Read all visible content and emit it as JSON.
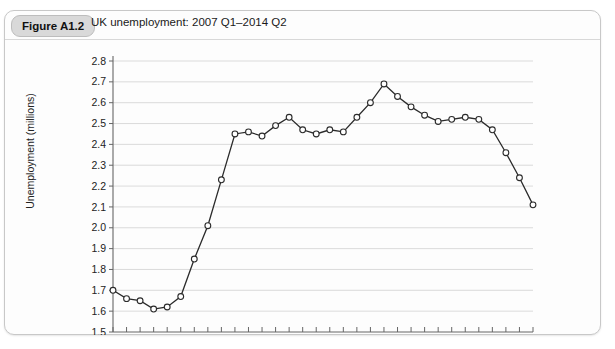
{
  "figure": {
    "badge": "Figure A1.2",
    "title": "UK unemployment: 2007 Q1–2014 Q2"
  },
  "chart_data": {
    "type": "line",
    "title": "UK unemployment: 2007 Q1–2014 Q2",
    "xlabel": "",
    "ylabel": "Unemployment (millions)",
    "ylim": [
      1.5,
      2.8
    ],
    "ytick_labels": [
      "1.5",
      "1.6",
      "1.7",
      "1.8",
      "1.9",
      "2.0",
      "2.1",
      "2.2",
      "2.3",
      "2.4",
      "2.5",
      "2.6",
      "2.7",
      "2.8"
    ],
    "ytick_values": [
      1.5,
      1.6,
      1.7,
      1.8,
      1.9,
      2.0,
      2.1,
      2.2,
      2.3,
      2.4,
      2.5,
      2.6,
      2.7,
      2.8
    ],
    "xtick_labels": [
      "2007",
      "2008",
      "2009",
      "2010",
      "2011",
      "2012",
      "2013",
      "2014"
    ],
    "xlim": [
      2007.0,
      2014.75
    ],
    "grid": "horizontal",
    "legend": "none",
    "marker": "open-circle",
    "x": [
      "2007 Q1",
      "2007 Q2",
      "2007 Q3",
      "2007 Q4",
      "2008 Q1",
      "2008 Q2",
      "2008 Q3",
      "2008 Q4",
      "2009 Q1",
      "2009 Q2",
      "2009 Q3",
      "2009 Q4",
      "2010 Q1",
      "2010 Q2",
      "2010 Q3",
      "2010 Q4",
      "2011 Q1",
      "2011 Q2",
      "2011 Q3",
      "2011 Q4",
      "2012 Q1",
      "2012 Q2",
      "2012 Q3",
      "2012 Q4",
      "2013 Q1",
      "2013 Q2",
      "2013 Q3",
      "2013 Q4",
      "2014 Q1",
      "2014 Q2"
    ],
    "x_numeric": [
      2007.0,
      2007.25,
      2007.5,
      2007.75,
      2008.0,
      2008.25,
      2008.5,
      2008.75,
      2009.0,
      2009.25,
      2009.5,
      2009.75,
      2010.0,
      2010.25,
      2010.5,
      2010.75,
      2011.0,
      2011.25,
      2011.5,
      2011.75,
      2012.0,
      2012.25,
      2012.5,
      2012.75,
      2013.0,
      2013.25,
      2013.5,
      2013.75,
      2014.0,
      2014.25
    ],
    "values": [
      1.7,
      1.66,
      1.65,
      1.61,
      1.62,
      1.67,
      1.85,
      2.01,
      2.23,
      2.45,
      2.46,
      2.44,
      2.49,
      2.53,
      2.47,
      2.45,
      2.47,
      2.46,
      2.53,
      2.6,
      2.69,
      2.63,
      2.58,
      2.54,
      2.51,
      2.52,
      2.53,
      2.52,
      2.47,
      2.36
    ],
    "final_values_tail": [
      2.24,
      2.11
    ]
  },
  "colors": {
    "line": "#2b2b2b",
    "grid": "#d2d2d2",
    "axis": "#666666",
    "badge_bg": "#d9d9d9",
    "card_bg": "#fdfdfd"
  }
}
